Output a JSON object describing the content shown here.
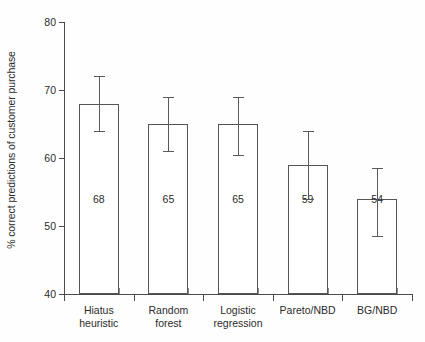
{
  "chart_data": {
    "type": "bar",
    "title": "",
    "xlabel": "",
    "ylabel": "% correct predictions of customer purchase",
    "ylim": [
      40,
      80
    ],
    "yticks": [
      40,
      50,
      60,
      70,
      80
    ],
    "ytick_labels": [
      "40",
      "50",
      "60",
      "70",
      "80"
    ],
    "grid": false,
    "legend": null,
    "categories": [
      "Hiatus heuristic",
      "Random forest",
      "Logistic regression",
      "Pareto/NBD",
      "BG/NBD"
    ],
    "category_lines": [
      [
        "Hiatus",
        "heuristic"
      ],
      [
        "Random",
        "forest"
      ],
      [
        "Logistic",
        "regression"
      ],
      [
        "Pareto/NBD"
      ],
      [
        "BG/NBD"
      ]
    ],
    "values": [
      68,
      65,
      65,
      59,
      54
    ],
    "value_labels": [
      "68",
      "65",
      "65",
      "59",
      "54"
    ],
    "error_low": [
      64,
      61,
      60.5,
      54,
      48.5
    ],
    "error_high": [
      72,
      69,
      69,
      64,
      58.5
    ],
    "bar_fill": "#ffffff",
    "bar_edge": "#555555",
    "axis_color": "#4a4a4a",
    "text_color": "#2b2b2b",
    "background": "#fefefe"
  }
}
